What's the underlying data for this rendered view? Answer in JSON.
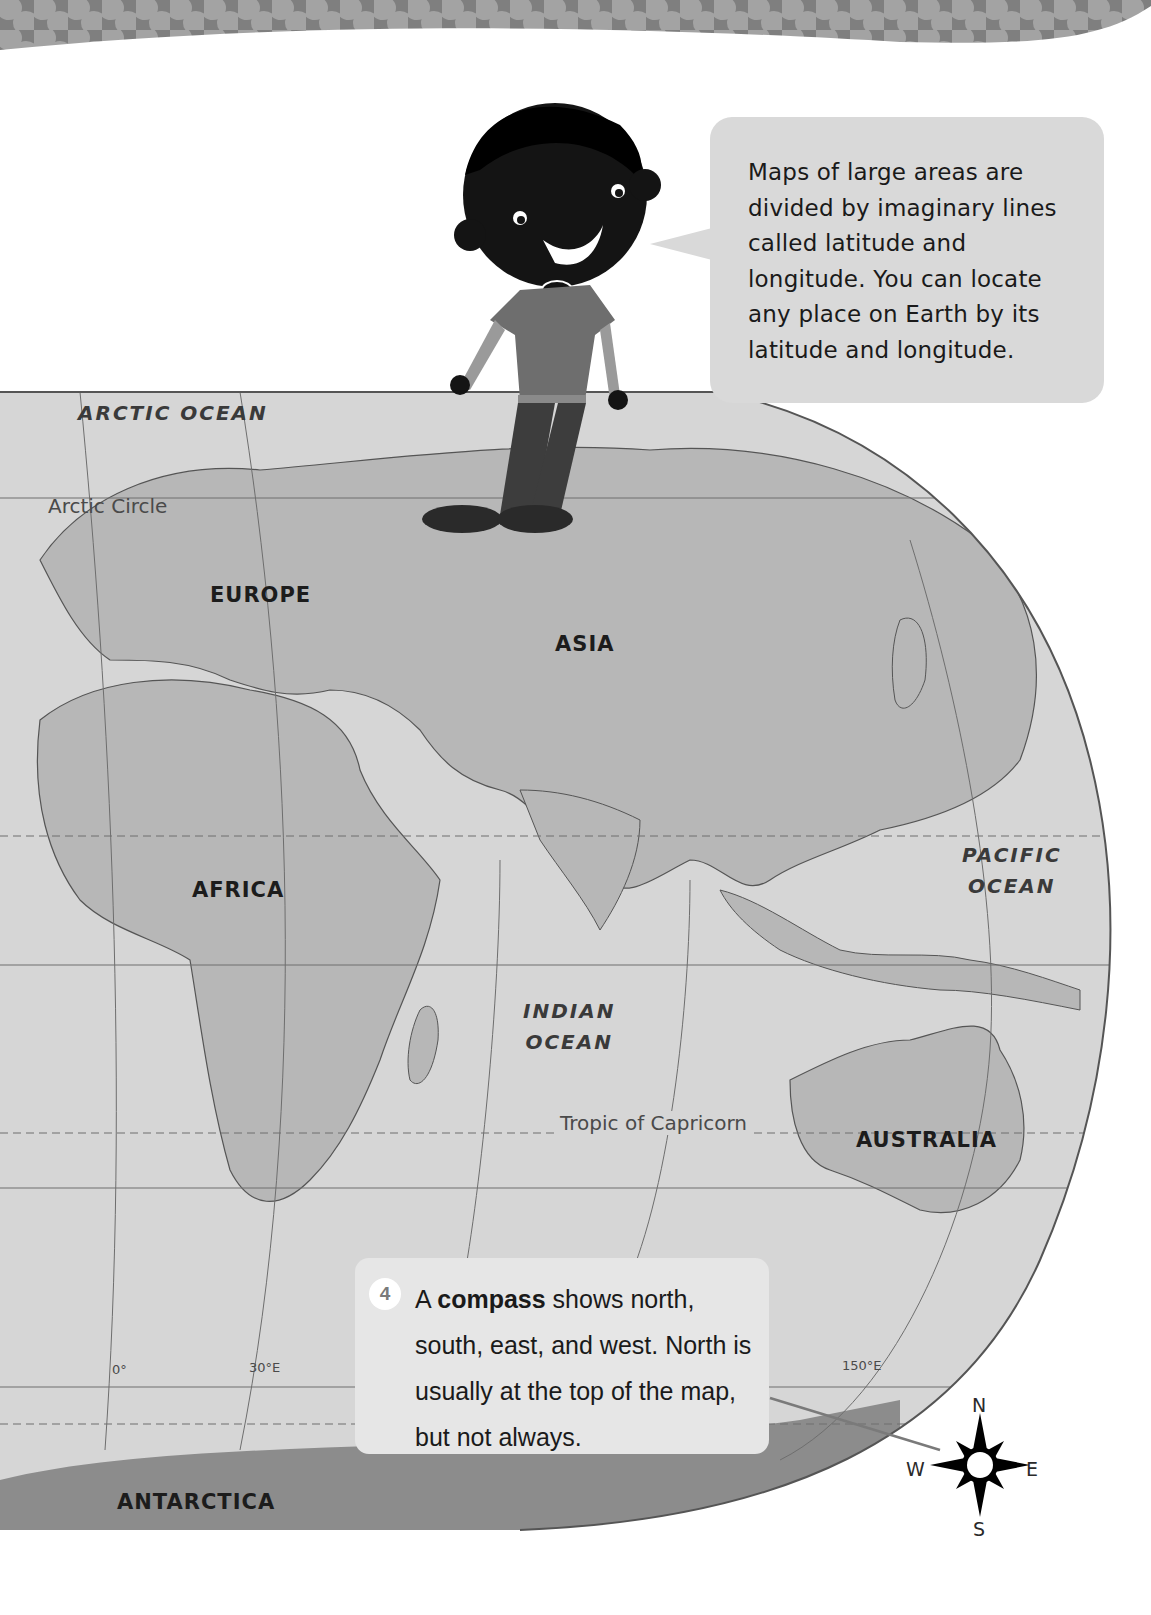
{
  "page": {
    "header_band": {
      "color": "#8c8c8c",
      "dot_color": "#a6a6a6"
    }
  },
  "speech_bubble": {
    "text": "Maps of large areas are divided by imaginary lines called latitude and longitude. You can locate any place on Earth by its latitude and longitude.",
    "background": "#d9d9d9"
  },
  "map": {
    "ocean_color": "#d4d4d4",
    "land_color": "#b5b5b5",
    "antarctica_color": "#8a8a8a",
    "labels": {
      "arctic_ocean": "ARCTIC OCEAN",
      "arctic_circle": "Arctic Circle",
      "europe": "EUROPE",
      "asia": "ASIA",
      "africa": "AFRICA",
      "pacific_ocean_line1": "PACIFIC",
      "pacific_ocean_line2": "OCEAN",
      "indian_ocean_line1": "INDIAN",
      "indian_ocean_line2": "OCEAN",
      "tropic_of_capricorn": "Tropic of  Capricorn",
      "australia": "AUSTRALIA",
      "antarctica": "ANTARCTICA"
    },
    "longitude_labels": [
      "0°",
      "30°E",
      "150°E"
    ]
  },
  "callout": {
    "number": "4",
    "text_before": "A ",
    "term": "compass",
    "text_after": " shows north, south, east, and west. North is usually at the top of the map, but not always."
  },
  "compass": {
    "north": "N",
    "south": "S",
    "east": "E",
    "west": "W"
  }
}
